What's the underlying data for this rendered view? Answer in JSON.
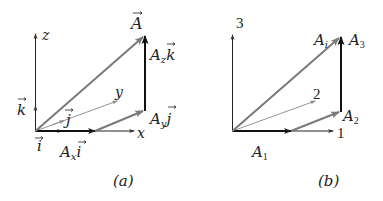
{
  "colors": {
    "axis": "#222222",
    "resultant": "#808080",
    "component_bold": "#1a1a1a",
    "thin_axis": "#888888"
  },
  "panel_a": {
    "caption": "(a)",
    "axis_labels": {
      "z": "z",
      "y": "y",
      "x": "x"
    },
    "unit_vectors": {
      "i": "i",
      "j": "j",
      "k": "k"
    },
    "vector_labels": {
      "A": "A",
      "Ax_i": {
        "coef": "A",
        "sub": "x",
        "unit": "i"
      },
      "Ay_j": {
        "coef": "A",
        "sub": "y",
        "unit": "j"
      },
      "Az_k": {
        "coef": "A",
        "sub": "z",
        "unit": "k"
      }
    }
  },
  "panel_b": {
    "caption": "(b)",
    "axis_labels": {
      "a3": "3",
      "a2": "2",
      "a1": "1"
    },
    "vector_labels": {
      "Ai": {
        "base": "A",
        "sub": "i"
      },
      "A1": {
        "base": "A",
        "sub": "1"
      },
      "A2": {
        "base": "A",
        "sub": "2"
      },
      "A3": {
        "base": "A",
        "sub": "3"
      }
    }
  }
}
